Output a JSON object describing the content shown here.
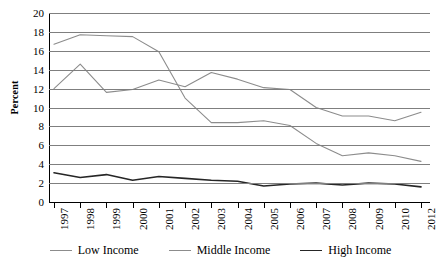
{
  "chart_data": {
    "type": "line",
    "title": "",
    "subtitle": "",
    "xlabel": "",
    "ylabel": "Percent",
    "ylim": [
      0,
      20
    ],
    "ytick_step": 2,
    "yticks": [
      20,
      18,
      16,
      14,
      12,
      10,
      8,
      6,
      4,
      2,
      0
    ],
    "grid": true,
    "grid_axis": "y",
    "legend_position": "bottom",
    "categories": [
      "1997",
      "1998",
      "1999",
      "2000",
      "2001",
      "2002",
      "2003",
      "2004",
      "2005",
      "2006",
      "2007",
      "2008",
      "2009",
      "2010",
      "2012"
    ],
    "x": [
      "1997",
      "1998",
      "1999",
      "2000",
      "2001",
      "2002",
      "2003",
      "2004",
      "2005",
      "2006",
      "2007",
      "2008",
      "2009",
      "2010",
      "2012"
    ],
    "series": [
      {
        "name": "Low Income",
        "color": "#8c8c8c",
        "values": [
          16.7,
          17.7,
          17.6,
          17.5,
          15.9,
          11.0,
          8.4,
          8.4,
          8.6,
          8.1,
          6.2,
          4.9,
          5.2,
          4.9,
          4.3
        ]
      },
      {
        "name": "Middle Income",
        "color": "#8c8c8c",
        "values": [
          12.0,
          14.6,
          11.6,
          11.9,
          12.9,
          12.2,
          13.7,
          13.0,
          12.1,
          11.9,
          10.0,
          9.1,
          9.1,
          8.6,
          9.5
        ]
      },
      {
        "name": "High Income",
        "color": "#262626",
        "values": [
          3.1,
          2.6,
          2.9,
          2.3,
          2.7,
          2.5,
          2.3,
          2.2,
          1.7,
          1.9,
          2.0,
          1.8,
          2.0,
          1.9,
          1.6
        ]
      }
    ]
  },
  "legend": {
    "items": [
      {
        "label": "Low Income",
        "color": "#8c8c8c",
        "width": "1.3px"
      },
      {
        "label": "Middle Income",
        "color": "#8c8c8c",
        "width": "1.3px"
      },
      {
        "label": "High Income",
        "color": "#262626",
        "width": "1.9px"
      }
    ]
  },
  "axis": {
    "y_title": "Percent"
  }
}
